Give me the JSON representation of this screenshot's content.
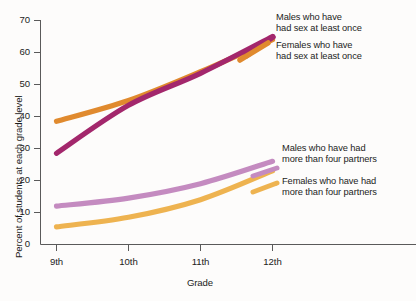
{
  "chart_data": {
    "type": "line",
    "title": "",
    "xlabel": "Grade",
    "ylabel": "Percent of students at each grade level",
    "categories": [
      "9th",
      "10th",
      "11th",
      "12th"
    ],
    "yticks": [
      0,
      10,
      20,
      30,
      40,
      50,
      60,
      70
    ],
    "ylim": [
      0,
      70
    ],
    "grid": false,
    "legend_position": "inline-right-annotations",
    "series": [
      {
        "name": "Males who have had sex at least once",
        "label_line1": "Males who have",
        "label_line2": "had sex at least once",
        "color": "#E08A2E",
        "values": [
          38.5,
          45.0,
          54.0,
          64.0
        ]
      },
      {
        "name": "Females who have had sex at least once",
        "label_line1": "Females who have",
        "label_line2": "had sex at least once",
        "color": "#A3276C",
        "values": [
          28.5,
          43.5,
          53.5,
          65.0
        ]
      },
      {
        "name": "Males who have had more than four partners",
        "label_line1": "Males who have had",
        "label_line2": "more than four partners",
        "color": "#C48BC0",
        "values": [
          12.0,
          14.5,
          19.0,
          26.0
        ]
      },
      {
        "name": "Females who have had more than four partners",
        "label_line1": "Females who have had",
        "label_line2": "more than four partners",
        "color": "#EEB350",
        "values": [
          5.5,
          8.5,
          14.0,
          23.0
        ]
      }
    ]
  },
  "axis": {
    "y_label": "Percent of students at each grade level",
    "x_label": "Grade",
    "y_tick_0": "0",
    "y_tick_10": "10",
    "y_tick_20": "20",
    "y_tick_30": "30",
    "y_tick_40": "40",
    "y_tick_50": "50",
    "y_tick_60": "60",
    "y_tick_70": "70",
    "x_tick_9": "9th",
    "x_tick_10": "10th",
    "x_tick_11": "11th",
    "x_tick_12": "12th"
  },
  "annotations": {
    "males_sex_l1": "Males who have",
    "males_sex_l2": "had sex at least once",
    "females_sex_l1": "Females who have",
    "females_sex_l2": "had sex at least once",
    "males_partners_l1": "Males who have had",
    "males_partners_l2": "more than four partners",
    "females_partners_l1": "Females who have had",
    "females_partners_l2": "more than four partners"
  }
}
